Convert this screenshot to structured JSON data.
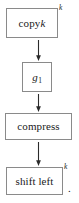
{
  "diagram": {
    "orientation": "vertical-top-to-bottom",
    "stroke_color": "#8a8a8a",
    "text_color": "#1a1a1a",
    "background_color": "#ffffff",
    "nodes": [
      {
        "id": "copy",
        "label": "copy",
        "variable": "k",
        "exponent": "k",
        "shape": "rectangle"
      },
      {
        "id": "g1",
        "label": "g",
        "subscript": "1",
        "shape": "rectangle"
      },
      {
        "id": "compress",
        "label": "compress",
        "shape": "rectangle"
      },
      {
        "id": "shift",
        "label": "shift left",
        "exponent": "k",
        "shape": "rectangle"
      }
    ],
    "connectors": [
      {
        "id": "arrow-1",
        "from": "copy",
        "to": "g1",
        "glyph": "arrow-down-icon"
      },
      {
        "id": "arrow-2",
        "from": "g1",
        "to": "compress",
        "glyph": "arrow-down-icon"
      },
      {
        "id": "arrow-3",
        "from": "compress",
        "to": "shift",
        "glyph": "arrow-down-icon"
      }
    ],
    "trailing_punctuation": "."
  }
}
